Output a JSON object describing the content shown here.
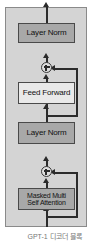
{
  "figure": {
    "caption": "GPT-1 디코더 블록",
    "colors": {
      "frame_fill": "#d4d4d4",
      "frame_border": "#8a8a8a",
      "shaded_box_fill": "#a8a8a8",
      "plain_box_fill": "#e9e9e9",
      "box_border": "#4a4a4a",
      "wire": "#2b2b2b",
      "caption_text": "#777777",
      "background": "#ffffff"
    }
  },
  "diagram": {
    "type": "flowchart",
    "title": "GPT-1 디코더 블록",
    "nodes": [
      {
        "id": "layer-norm-top",
        "label": "Layer Norm",
        "lines": [
          "Layer Norm"
        ],
        "style": "shaded"
      },
      {
        "id": "add-top",
        "label": "add",
        "lines": [
          "+"
        ],
        "style": "circle"
      },
      {
        "id": "feed-forward",
        "label": "Feed Forward",
        "lines": [
          "Feed Forward"
        ],
        "style": "plain"
      },
      {
        "id": "layer-norm-bottom",
        "label": "Layer Norm",
        "lines": [
          "Layer Norm"
        ],
        "style": "shaded"
      },
      {
        "id": "add-bottom",
        "label": "add",
        "lines": [
          "+"
        ],
        "style": "circle"
      },
      {
        "id": "masked-attention",
        "label": "Masked Multi Self Attention",
        "lines": [
          "Masked Multi",
          "Self Attention"
        ],
        "style": "shaded"
      }
    ],
    "edges": [
      {
        "from": "input",
        "to": "masked-attention",
        "kind": "arrow-up"
      },
      {
        "from": "masked-attention",
        "to": "add-bottom",
        "kind": "arrow-up"
      },
      {
        "from": "input",
        "to": "add-bottom",
        "kind": "residual-right"
      },
      {
        "from": "add-bottom",
        "to": "layer-norm-bottom",
        "kind": "arrow-up"
      },
      {
        "from": "layer-norm-bottom",
        "to": "feed-forward",
        "kind": "arrow-up"
      },
      {
        "from": "layer-norm-bottom",
        "to": "add-top",
        "kind": "residual-right"
      },
      {
        "from": "feed-forward",
        "to": "add-top",
        "kind": "arrow-up"
      },
      {
        "from": "add-top",
        "to": "layer-norm-top",
        "kind": "arrow-up"
      },
      {
        "from": "layer-norm-top",
        "to": "output",
        "kind": "arrow-up"
      }
    ],
    "labels": {
      "layer_norm_top": "Layer Norm",
      "feed_forward": "Feed Forward",
      "layer_norm_bottom": "Layer Norm",
      "masked_attention_line1": "Masked Multi",
      "masked_attention_line2": "Self Attention"
    }
  }
}
